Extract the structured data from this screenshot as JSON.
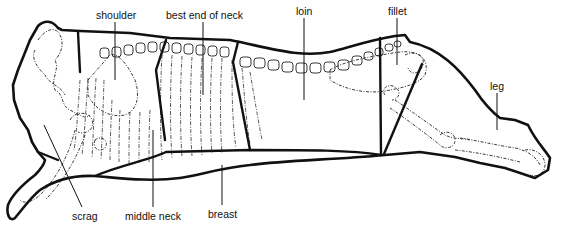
{
  "diagram": {
    "colors": {
      "line": "#111111",
      "background": "#ffffff"
    },
    "labels": {
      "shoulder": {
        "text": "shoulder",
        "x": 96,
        "y": 19,
        "leader": [
          115,
          23,
          115,
          80
        ]
      },
      "best_end_of_neck": {
        "text": "best end of neck",
        "x": 166,
        "y": 19,
        "leader": [
          203,
          23,
          203,
          95
        ]
      },
      "loin": {
        "text": "loin",
        "x": 296,
        "y": 15,
        "leader": [
          304,
          19,
          304,
          100
        ]
      },
      "fillet": {
        "text": "fillet",
        "x": 388,
        "y": 15,
        "leader": [
          397,
          19,
          397,
          65
        ]
      },
      "leg": {
        "text": "leg",
        "x": 490,
        "y": 90,
        "leader": [
          497,
          94,
          497,
          130
        ]
      },
      "scrag": {
        "text": "scrag",
        "x": 72,
        "y": 220,
        "leader": [
          44,
          125,
          82,
          207
        ]
      },
      "middle_neck": {
        "text": "middle neck",
        "x": 125,
        "y": 220,
        "leader": [
          153,
          130,
          153,
          207
        ]
      },
      "breast": {
        "text": "breast",
        "x": 208,
        "y": 218,
        "leader": [
          222,
          165,
          222,
          205
        ]
      }
    }
  }
}
